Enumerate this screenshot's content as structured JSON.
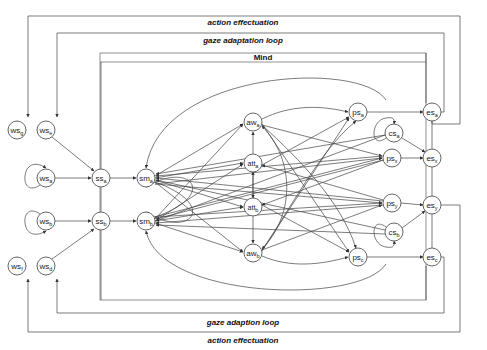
{
  "diagram": {
    "labels": {
      "action_top": "action effectuation",
      "gaze_top": "gaze adaptation loop",
      "mind": "Mind",
      "gaze_bottom": "gaze adaption loop",
      "action_bottom": "action effectuation"
    },
    "nodes": [
      {
        "id": "ws_g",
        "base": "ws",
        "sub": "g",
        "x": 17,
        "y": 130
      },
      {
        "id": "ws_e",
        "base": "ws",
        "sub": "e",
        "x": 46,
        "y": 130
      },
      {
        "id": "ws_a",
        "base": "ws",
        "sub": "a",
        "x": 46,
        "y": 178
      },
      {
        "id": "ws_b",
        "base": "ws",
        "sub": "b",
        "x": 46,
        "y": 221
      },
      {
        "id": "ws_f",
        "base": "ws",
        "sub": "f",
        "x": 17,
        "y": 266
      },
      {
        "id": "ws_d",
        "base": "ws",
        "sub": "d",
        "x": 46,
        "y": 266
      },
      {
        "id": "ss_a",
        "base": "ss",
        "sub": "a",
        "x": 101,
        "y": 178
      },
      {
        "id": "ss_b",
        "base": "ss",
        "sub": "b",
        "x": 101,
        "y": 221
      },
      {
        "id": "sm_a",
        "base": "sm",
        "sub": "a",
        "x": 146,
        "y": 178
      },
      {
        "id": "sm_b",
        "base": "sm",
        "sub": "b",
        "x": 146,
        "y": 221
      },
      {
        "id": "aw_a",
        "base": "aw",
        "sub": "a",
        "x": 253,
        "y": 122
      },
      {
        "id": "att_a",
        "base": "att",
        "sub": "a",
        "x": 253,
        "y": 163
      },
      {
        "id": "att_b",
        "base": "att",
        "sub": "b",
        "x": 253,
        "y": 207
      },
      {
        "id": "aw_b",
        "base": "aw",
        "sub": "b",
        "x": 253,
        "y": 253
      },
      {
        "id": "ps_a",
        "base": "ps",
        "sub": "a",
        "x": 358,
        "y": 112
      },
      {
        "id": "cs_a",
        "base": "cs",
        "sub": "a",
        "x": 394,
        "y": 133
      },
      {
        "id": "ps_x",
        "base": "ps",
        "sub": "x",
        "x": 392,
        "y": 158
      },
      {
        "id": "ps_y",
        "base": "ps",
        "sub": "y",
        "x": 392,
        "y": 203
      },
      {
        "id": "cs_b",
        "base": "cs",
        "sub": "b",
        "x": 394,
        "y": 232
      },
      {
        "id": "ps_c",
        "base": "ps",
        "sub": "c",
        "x": 358,
        "y": 257
      },
      {
        "id": "es_a",
        "base": "es",
        "sub": "a",
        "x": 432,
        "y": 112
      },
      {
        "id": "es_x",
        "base": "es",
        "sub": "x",
        "x": 432,
        "y": 158
      },
      {
        "id": "es_y",
        "base": "es",
        "sub": "y",
        "x": 432,
        "y": 205
      },
      {
        "id": "es_c",
        "base": "es",
        "sub": "c",
        "x": 432,
        "y": 257
      }
    ]
  }
}
